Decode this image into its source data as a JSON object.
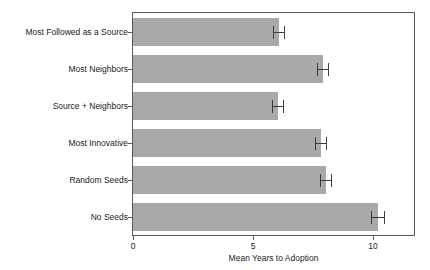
{
  "chart_data": {
    "type": "bar",
    "orientation": "horizontal",
    "title": "",
    "xlabel": "Mean Years to Adoption",
    "ylabel": "",
    "xlim": [
      0,
      11.75
    ],
    "xticks": [
      0,
      5,
      10
    ],
    "xticklabels": [
      "0",
      "5",
      "10"
    ],
    "grid": false,
    "legend": null,
    "bar_color": "#a9a9a9",
    "error_color": "#3d3d3d",
    "frame_color": "#5a5a5a",
    "background": "#ffffff",
    "categories": [
      "Most Followed as a Source",
      "Most Neighbors",
      "Source + Neighbors",
      "Most Innovative",
      "Random Seeds",
      "No Seeds"
    ],
    "values": [
      6.1,
      7.9,
      6.05,
      7.85,
      8.05,
      10.2
    ],
    "errors": [
      0.25,
      0.25,
      0.25,
      0.25,
      0.25,
      0.3
    ],
    "series": [
      {
        "name": "Mean Years to Adoption",
        "values": [
          6.1,
          7.9,
          6.05,
          7.85,
          8.05,
          10.2
        ],
        "errors": [
          0.25,
          0.25,
          0.25,
          0.25,
          0.25,
          0.3
        ]
      }
    ]
  }
}
